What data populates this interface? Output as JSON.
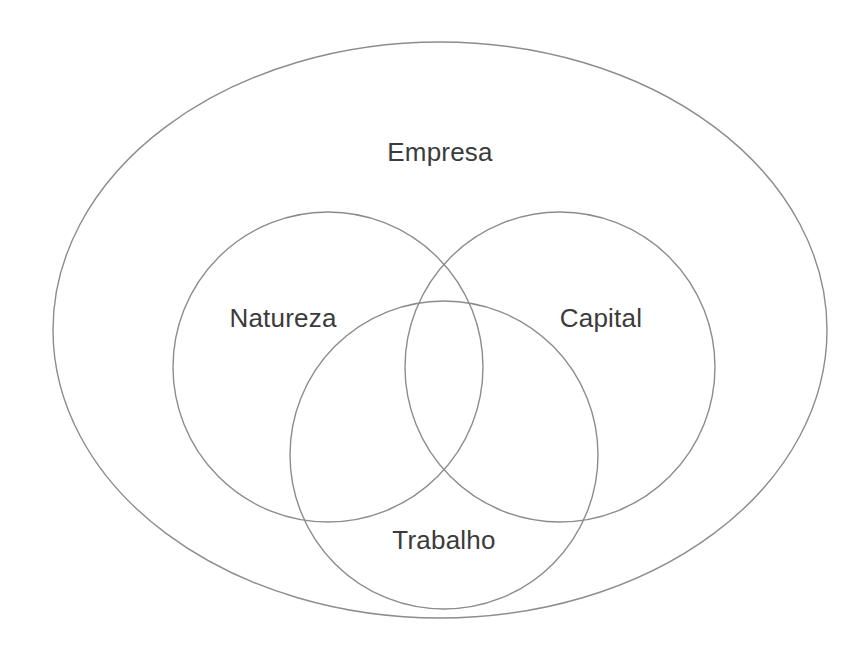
{
  "diagram": {
    "type": "venn-diagram",
    "title": "Empresa",
    "stroke_color": "#8c8c8c",
    "text_color": "#3b3b3b",
    "background_color": "#ffffff",
    "sets": [
      {
        "key": "empresa",
        "label": "Empresa",
        "shape": "ellipse",
        "role": "universe",
        "cx": 440,
        "cy": 330,
        "rx": 387,
        "ry": 288,
        "label_x": 440,
        "label_y": 152
      },
      {
        "key": "natureza",
        "label": "Natureza",
        "shape": "circle",
        "role": "subset",
        "cx": 328,
        "cy": 367,
        "r": 155,
        "label_x": 283,
        "label_y": 318
      },
      {
        "key": "capital",
        "label": "Capital",
        "shape": "circle",
        "role": "subset",
        "cx": 560,
        "cy": 367,
        "r": 155,
        "label_x": 601,
        "label_y": 318
      },
      {
        "key": "trabalho",
        "label": "Trabalho",
        "shape": "circle",
        "role": "subset",
        "cx": 444,
        "cy": 455,
        "r": 154,
        "label_x": 444,
        "label_y": 540
      }
    ]
  }
}
